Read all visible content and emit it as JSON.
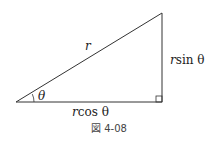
{
  "figure": {
    "caption": "図 4-08",
    "labels": {
      "hypotenuse": "r",
      "angle": "θ",
      "adjacent_r": "r",
      "adjacent_fn": "cos θ",
      "opposite_r": "r",
      "opposite_fn": "sin θ"
    },
    "colors": {
      "line": "#333333",
      "text": "#222222"
    }
  }
}
